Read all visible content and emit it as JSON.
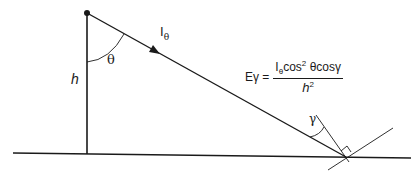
{
  "diagram": {
    "type": "point-source illuminance geometry",
    "labels": {
      "height": "h",
      "angle_theta": "θ",
      "intensity_base": "I",
      "intensity_sub": "θ",
      "angle_gamma": "γ"
    },
    "formula": {
      "lhs": "Eγ =",
      "numerator_I": "I",
      "numerator_sub": "θ",
      "numerator_cos": "cos",
      "numerator_exp": "2",
      "numerator_rest": " θcosγ",
      "denominator_base": "h",
      "denominator_exp": "2"
    },
    "colors": {
      "line": "#1a1a1a",
      "background": "#ffffff"
    }
  }
}
